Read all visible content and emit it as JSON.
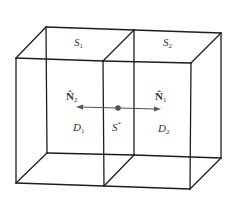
{
  "diagram": {
    "labels": {
      "surface_1": {
        "base": "S",
        "sub": "1"
      },
      "surface_2": {
        "base": "S",
        "sub": "2"
      },
      "normal_2": {
        "base": "N̂",
        "sub": "2"
      },
      "normal_1": {
        "base": "N̂",
        "sub": "1"
      },
      "domain_1": {
        "base": "D",
        "sub": "1"
      },
      "domain_2": {
        "base": "D",
        "sub": "2"
      },
      "interface": {
        "base": "S",
        "sup": "*"
      }
    },
    "colors": {
      "edge": "#1e1e1e",
      "arrow": "#555555",
      "text": "#333333"
    }
  }
}
